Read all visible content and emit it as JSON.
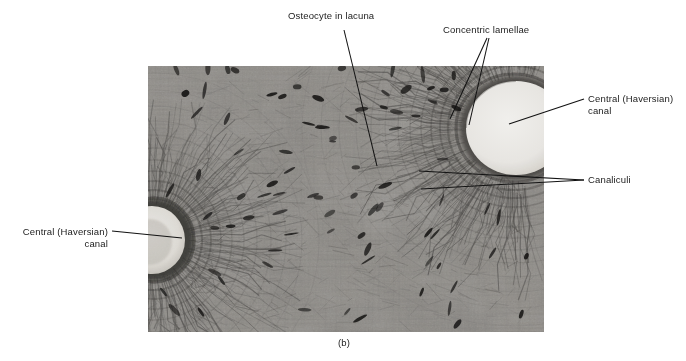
{
  "figure": {
    "caption": "(b)",
    "image_alt_name": "bone-compact-osteon-micrograph"
  },
  "labels": [
    {
      "id": "osteocyte",
      "name": "label-osteocyte-in-lacuna",
      "text": "Osteocyte in lacuna",
      "align": "left",
      "x": 288,
      "y": 10
    },
    {
      "id": "lamellae",
      "name": "label-concentric-lamellae",
      "text": "Concentric lamellae",
      "align": "left",
      "x": 443,
      "y": 24
    },
    {
      "id": "canal-right",
      "name": "label-central-haversian-canal-right",
      "text": "Central (Haversian)\ncanal",
      "align": "left",
      "x": 588,
      "y": 93
    },
    {
      "id": "canaliculi",
      "name": "label-canaliculi",
      "text": "Canaliculi",
      "align": "left",
      "x": 588,
      "y": 174
    },
    {
      "id": "canal-left",
      "name": "label-central-haversian-canal-left",
      "text": "Central (Haversian)\ncanal",
      "align": "right",
      "x": 12,
      "y": 226
    }
  ],
  "leader_lines": [
    {
      "name": "leader-osteocyte",
      "x1": 344,
      "y1": 30,
      "x2": 377,
      "y2": 166
    },
    {
      "name": "leader-lamellae-left",
      "x1": 487,
      "y1": 38,
      "x2": 450,
      "y2": 119
    },
    {
      "name": "leader-lamellae-right",
      "x1": 489,
      "y1": 38,
      "x2": 469,
      "y2": 125
    },
    {
      "name": "leader-canal-right",
      "x1": 584,
      "y1": 99,
      "x2": 509,
      "y2": 124
    },
    {
      "name": "leader-canaliculi-upper",
      "x1": 584,
      "y1": 180,
      "x2": 419,
      "y2": 171
    },
    {
      "name": "leader-canaliculi-lower",
      "x1": 584,
      "y1": 180,
      "x2": 421,
      "y2": 189
    },
    {
      "name": "leader-canal-left",
      "x1": 112,
      "y1": 231,
      "x2": 182,
      "y2": 238
    }
  ],
  "caption_pos": {
    "x": 338,
    "y": 343
  },
  "colors": {
    "text": "#1b1b1b",
    "leader": "#121212",
    "page_background": "#ffffff",
    "micrograph_base": "#8e8e8e",
    "micrograph_dark": "#2a2a2a",
    "canal_lumen": "#f2f0ec"
  },
  "micrograph": {
    "x": 148,
    "y": 66,
    "width": 396,
    "height": 266,
    "features": {
      "canal_right": {
        "cx": 366,
        "cy": 62,
        "rx": 52,
        "ry": 48
      },
      "canal_left": {
        "cx": 8,
        "cy": 174,
        "rx": 34,
        "ry": 36
      }
    }
  }
}
